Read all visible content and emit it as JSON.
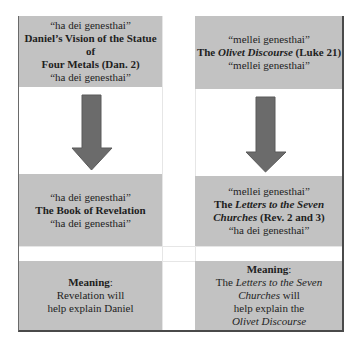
{
  "left_column": {
    "top_box": {
      "quote_top": "“ha dei genesthai”",
      "title_line1": "Daniel’s Vision of the Statue of",
      "title_line2": "Four Metals (Dan. 2)",
      "quote_bottom": "“ha dei genesthai”"
    },
    "arrow": "down-arrow",
    "middle_box": {
      "quote_top": "“ha dei genesthai”",
      "title": "The Book of Revelation",
      "quote_bottom": "“ha dei genesthai”"
    },
    "meaning_box": {
      "label": "Meaning",
      "colon": ":",
      "line1": "Revelation will",
      "line2": "help explain Daniel"
    }
  },
  "right_column": {
    "top_box": {
      "quote_top": "“mellei genesthai”",
      "title_prefix": "The ",
      "title_italic": "Olivet Discourse",
      "title_suffix": " (Luke 21)",
      "quote_bottom": "“mellei genesthai”"
    },
    "arrow": "down-arrow",
    "middle_box": {
      "quote_top": "“mellei genesthai”",
      "title_prefix": "The ",
      "title_italic_line1": "Letters to the Seven",
      "title_italic_line2": "Churches",
      "title_suffix": " (Rev. 2 and 3)",
      "quote_bottom": "“ha dei genesthai”"
    },
    "meaning_box": {
      "label": "Meaning",
      "colon": ":",
      "line1_prefix": "The ",
      "line1_italic": "Letters to the Seven",
      "line2_italic": "Churches",
      "line2_suffix": " will",
      "line3": "help explain the",
      "line4_italic": "Olivet Discourse"
    }
  },
  "colors": {
    "panel_fill": "#c2c2c2",
    "arrow_fill": "#6b6b6b",
    "text": "#1e1e1e",
    "border": "#4a4a4a"
  }
}
